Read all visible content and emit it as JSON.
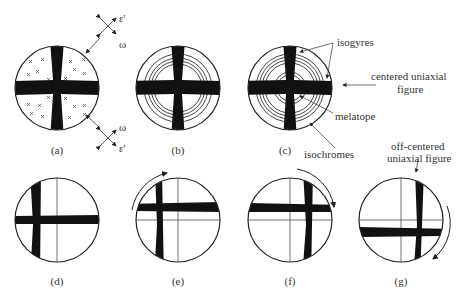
{
  "panels": [
    {
      "id": "a",
      "caption": "(a)"
    },
    {
      "id": "b",
      "caption": "(b)"
    },
    {
      "id": "c",
      "caption": "(c)"
    },
    {
      "id": "d",
      "caption": "(d)"
    },
    {
      "id": "e",
      "caption": "(e)"
    },
    {
      "id": "f",
      "caption": "(f)"
    },
    {
      "id": "g",
      "caption": "(g)"
    }
  ],
  "annotations": {
    "epsilon_top": "ε'",
    "omega_top": "ω",
    "omega_bottom": "ω",
    "epsilon_bottom": "ε'",
    "isogyres": "isogyres",
    "centered_line1": "centered uniaxial",
    "centered_line2": "figure",
    "melatope": "melatope",
    "isochromes": "isochromes",
    "offcentered_line1": "off-centered",
    "offcentered_line2": "uniaxial figure"
  }
}
